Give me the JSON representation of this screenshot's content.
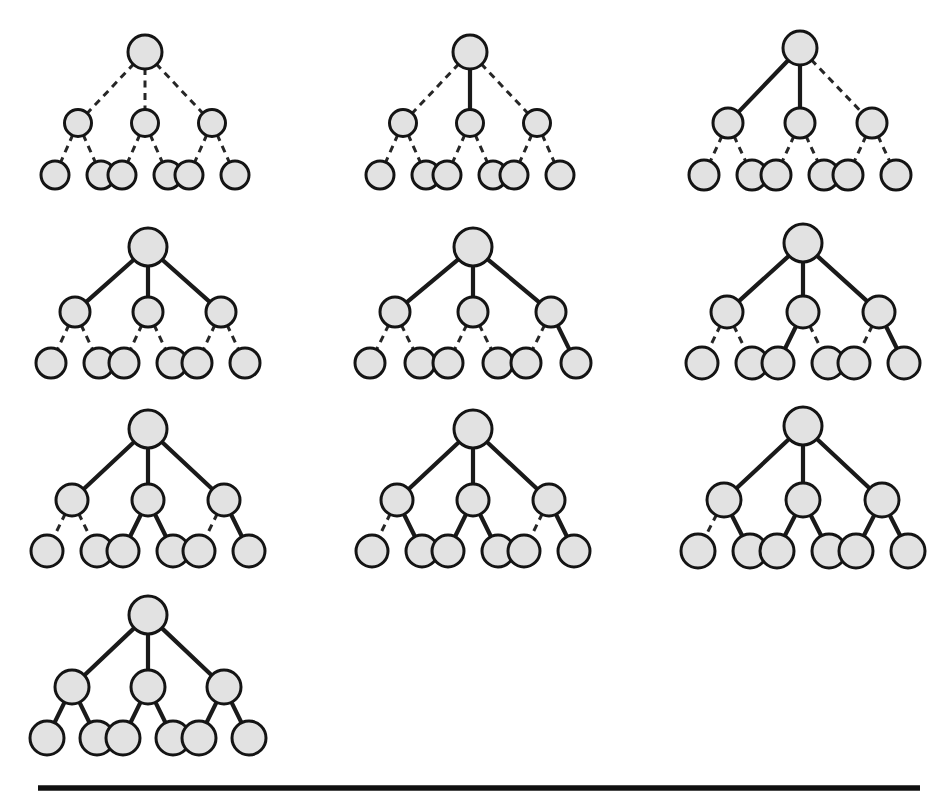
{
  "figure": {
    "background_color": "#ffffff",
    "node_fill": "#e2e2e2",
    "node_stroke": "#141414",
    "solid_edge_color": "#1a1a1a",
    "dashed_edge_color": "#262626",
    "panel_count": 10,
    "panel_columns": 3,
    "panel_rows": 4,
    "tree_shape": {
      "depth": 2,
      "root_children": 3,
      "children_per_internal": 2,
      "node_count": 10,
      "edge_count": 9
    },
    "edge_styles": [
      "dashed",
      "solid"
    ],
    "rule": {
      "x1": 38,
      "x2": 920,
      "y": 788,
      "color": "#101010"
    }
  },
  "layout": {
    "panels": [
      {
        "id": "panel-1",
        "cx": 145,
        "root_y": 52,
        "mid_y": 123,
        "leaf_y": 175,
        "mid_dx": 67,
        "leaf_dx": 23,
        "r_root": 17,
        "r_mid": 13.5,
        "r_leaf": 14
      },
      {
        "id": "panel-2",
        "cx": 470,
        "root_y": 52,
        "mid_y": 123,
        "leaf_y": 175,
        "mid_dx": 67,
        "leaf_dx": 23,
        "r_root": 17,
        "r_mid": 13.5,
        "r_leaf": 14
      },
      {
        "id": "panel-3",
        "cx": 800,
        "root_y": 48,
        "mid_y": 123,
        "leaf_y": 175,
        "mid_dx": 72,
        "leaf_dx": 24,
        "r_root": 17,
        "r_mid": 15,
        "r_leaf": 15
      },
      {
        "id": "panel-4",
        "cx": 148,
        "root_y": 247,
        "mid_y": 312,
        "leaf_y": 363,
        "mid_dx": 73,
        "leaf_dx": 24,
        "r_root": 19,
        "r_mid": 15,
        "r_leaf": 15
      },
      {
        "id": "panel-5",
        "cx": 473,
        "root_y": 247,
        "mid_y": 312,
        "leaf_y": 363,
        "mid_dx": 78,
        "leaf_dx": 25,
        "r_root": 19,
        "r_mid": 15,
        "r_leaf": 15
      },
      {
        "id": "panel-6",
        "cx": 803,
        "root_y": 243,
        "mid_y": 312,
        "leaf_y": 363,
        "mid_dx": 76,
        "leaf_dx": 25,
        "r_root": 19,
        "r_mid": 16,
        "r_leaf": 16
      },
      {
        "id": "panel-7",
        "cx": 148,
        "root_y": 429,
        "mid_y": 500,
        "leaf_y": 551,
        "mid_dx": 76,
        "leaf_dx": 25,
        "r_root": 19,
        "r_mid": 16,
        "r_leaf": 16
      },
      {
        "id": "panel-8",
        "cx": 473,
        "root_y": 429,
        "mid_y": 500,
        "leaf_y": 551,
        "mid_dx": 76,
        "leaf_dx": 25,
        "r_root": 19,
        "r_mid": 16,
        "r_leaf": 16
      },
      {
        "id": "panel-9",
        "cx": 803,
        "root_y": 426,
        "mid_y": 500,
        "leaf_y": 551,
        "mid_dx": 79,
        "leaf_dx": 26,
        "r_root": 19,
        "r_mid": 17,
        "r_leaf": 17
      },
      {
        "id": "panel-10",
        "cx": 148,
        "root_y": 615,
        "mid_y": 687,
        "leaf_y": 738,
        "mid_dx": 76,
        "leaf_dx": 25,
        "r_root": 19,
        "r_mid": 17,
        "r_leaf": 17
      }
    ]
  },
  "panels": [
    {
      "index": 1,
      "label": "Tree 1",
      "solid_edge_count": 0,
      "root_edges": [
        "dashed",
        "dashed",
        "dashed"
      ],
      "leaf_edges": [
        [
          "dashed",
          "dashed"
        ],
        [
          "dashed",
          "dashed"
        ],
        [
          "dashed",
          "dashed"
        ]
      ]
    },
    {
      "index": 2,
      "label": "Tree 2",
      "solid_edge_count": 1,
      "root_edges": [
        "dashed",
        "solid",
        "dashed"
      ],
      "leaf_edges": [
        [
          "dashed",
          "dashed"
        ],
        [
          "dashed",
          "dashed"
        ],
        [
          "dashed",
          "dashed"
        ]
      ]
    },
    {
      "index": 3,
      "label": "Tree 3",
      "solid_edge_count": 2,
      "root_edges": [
        "solid",
        "solid",
        "dashed"
      ],
      "leaf_edges": [
        [
          "dashed",
          "dashed"
        ],
        [
          "dashed",
          "dashed"
        ],
        [
          "dashed",
          "dashed"
        ]
      ]
    },
    {
      "index": 4,
      "label": "Tree 4",
      "solid_edge_count": 3,
      "root_edges": [
        "solid",
        "solid",
        "solid"
      ],
      "leaf_edges": [
        [
          "dashed",
          "dashed"
        ],
        [
          "dashed",
          "dashed"
        ],
        [
          "dashed",
          "dashed"
        ]
      ]
    },
    {
      "index": 5,
      "label": "Tree 5",
      "solid_edge_count": 4,
      "root_edges": [
        "solid",
        "solid",
        "solid"
      ],
      "leaf_edges": [
        [
          "dashed",
          "dashed"
        ],
        [
          "dashed",
          "dashed"
        ],
        [
          "dashed",
          "solid"
        ]
      ]
    },
    {
      "index": 6,
      "label": "Tree 6",
      "solid_edge_count": 5,
      "root_edges": [
        "solid",
        "solid",
        "solid"
      ],
      "leaf_edges": [
        [
          "dashed",
          "dashed"
        ],
        [
          "solid",
          "dashed"
        ],
        [
          "dashed",
          "solid"
        ]
      ]
    },
    {
      "index": 7,
      "label": "Tree 7",
      "solid_edge_count": 6,
      "root_edges": [
        "solid",
        "solid",
        "solid"
      ],
      "leaf_edges": [
        [
          "dashed",
          "dashed"
        ],
        [
          "solid",
          "solid"
        ],
        [
          "dashed",
          "solid"
        ]
      ]
    },
    {
      "index": 8,
      "label": "Tree 8",
      "solid_edge_count": 7,
      "root_edges": [
        "solid",
        "solid",
        "solid"
      ],
      "leaf_edges": [
        [
          "dashed",
          "solid"
        ],
        [
          "solid",
          "solid"
        ],
        [
          "dashed",
          "solid"
        ]
      ]
    },
    {
      "index": 9,
      "label": "Tree 9",
      "solid_edge_count": 8,
      "root_edges": [
        "solid",
        "solid",
        "solid"
      ],
      "leaf_edges": [
        [
          "dashed",
          "solid"
        ],
        [
          "solid",
          "solid"
        ],
        [
          "solid",
          "solid"
        ]
      ]
    },
    {
      "index": 10,
      "label": "Tree 10",
      "solid_edge_count": 9,
      "root_edges": [
        "solid",
        "solid",
        "solid"
      ],
      "leaf_edges": [
        [
          "solid",
          "solid"
        ],
        [
          "solid",
          "solid"
        ],
        [
          "solid",
          "solid"
        ]
      ]
    }
  ]
}
